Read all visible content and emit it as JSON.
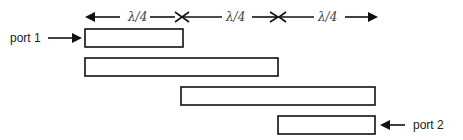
{
  "diagram": {
    "type": "coupled-line-filter",
    "ports": [
      {
        "id": "port-1",
        "label": "port 1",
        "direction": "in"
      },
      {
        "id": "port-2",
        "label": "port 2",
        "direction": "out"
      }
    ],
    "dimension_labels": [
      "λ/4",
      "λ/4",
      "λ/4"
    ],
    "sections": [
      {
        "id": "line-1",
        "length_quarter_waves": 1,
        "start_offset_quarter_waves": 0
      },
      {
        "id": "line-2",
        "length_quarter_waves": 2,
        "start_offset_quarter_waves": 0
      },
      {
        "id": "line-3",
        "length_quarter_waves": 2,
        "start_offset_quarter_waves": 1
      },
      {
        "id": "line-4",
        "length_quarter_waves": 1,
        "start_offset_quarter_waves": 2
      }
    ]
  }
}
